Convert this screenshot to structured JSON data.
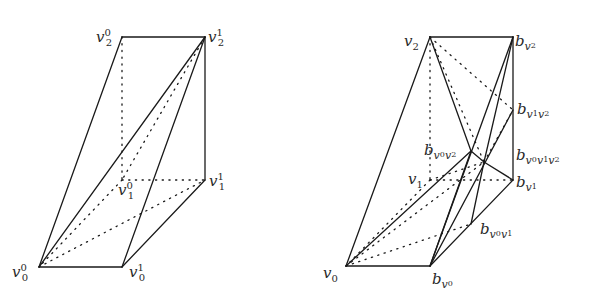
{
  "left_figure": {
    "labels": {
      "v2_0": {
        "base": "v",
        "sub": "2",
        "sup": "0"
      },
      "v2_1": {
        "base": "v",
        "sub": "2",
        "sup": "1"
      },
      "v1_0": {
        "base": "v",
        "sub": "1",
        "sup": "0"
      },
      "v1_1": {
        "base": "v",
        "sub": "1",
        "sup": "1"
      },
      "v0_0": {
        "base": "v",
        "sub": "0",
        "sup": "0"
      },
      "v0_1": {
        "base": "v",
        "sub": "0",
        "sup": "1"
      }
    }
  },
  "right_figure": {
    "labels": {
      "v2": {
        "base": "v",
        "sub": "2"
      },
      "v1": {
        "base": "v",
        "sub": "1"
      },
      "v0": {
        "base": "v",
        "sub": "0"
      },
      "b_v2": {
        "base": "b",
        "sub_v": "v",
        "sub_idx": "2"
      },
      "b_v1v2": {
        "base": "b",
        "sub_v": "v",
        "sub_idx": "1",
        "sub_v2": "v",
        "sub_idx2": "2"
      },
      "b_v0v2": {
        "base": "b",
        "sub_v": "v",
        "sub_idx": "0",
        "sub_v2": "v",
        "sub_idx2": "2"
      },
      "b_v0v1v2": {
        "base": "b",
        "sub_v": "v",
        "sub_idx": "0",
        "sub_v2": "v",
        "sub_idx2": "1",
        "sub_v3": "v",
        "sub_idx3": "2"
      },
      "b_v1": {
        "base": "b",
        "sub_v": "v",
        "sub_idx": "1"
      },
      "b_v0v1": {
        "base": "b",
        "sub_v": "v",
        "sub_idx": "0",
        "sub_v2": "v",
        "sub_idx2": "1"
      },
      "b_v0": {
        "base": "b",
        "sub_v": "v",
        "sub_idx": "0"
      }
    }
  }
}
